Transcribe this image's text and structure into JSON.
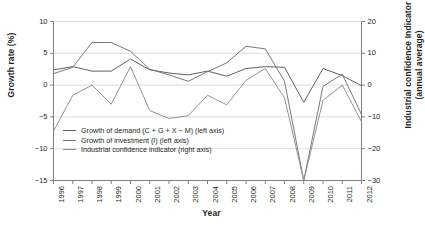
{
  "chart_data": {
    "type": "line",
    "title": "",
    "xlabel": "Year",
    "ylabel": "Growth rate (%)",
    "y2label_line1": "Industrial confidence Indicator",
    "y2label_line2": "(annual  average)",
    "x": [
      1996,
      1997,
      1998,
      1999,
      2000,
      2001,
      2002,
      2003,
      2004,
      2005,
      2006,
      2007,
      2008,
      2009,
      2010,
      2011,
      2012
    ],
    "xticklabels": [
      "1996",
      "1997",
      "1998",
      "1999",
      "2000",
      "2001",
      "2002",
      "2003",
      "2004",
      "2005",
      "2006",
      "2007",
      "2008",
      "2009",
      "2010",
      "2011",
      "2012"
    ],
    "ylim": [
      -15,
      10
    ],
    "yticks": [
      10,
      5,
      0,
      -5,
      -10,
      -15
    ],
    "yticklabels": [
      "10",
      "5",
      "0",
      "−5",
      "−10",
      "−15"
    ],
    "y2lim": [
      -30,
      20
    ],
    "y2ticks": [
      20,
      10,
      0,
      -10,
      -20,
      -30
    ],
    "y2ticklabels": [
      "20",
      "10",
      "0",
      "−10",
      "−20",
      "−30"
    ],
    "grid": true,
    "grid_axis": "y",
    "legend_position": "center-left",
    "series": [
      {
        "name": "Growth of demand (C + G + X − M) (left axis)",
        "axis": "left",
        "color": "#55595c",
        "values": [
          2.4,
          2.9,
          2.2,
          2.2,
          4.1,
          2.4,
          1.9,
          1.6,
          2.2,
          1.4,
          2.6,
          2.9,
          2.8,
          -2.7,
          2.6,
          1.5,
          -0.1
        ]
      },
      {
        "name": "Growth of investment (I) (left axis)",
        "axis": "left",
        "color": "#6f7274",
        "values": [
          1.8,
          2.8,
          6.7,
          6.7,
          5.3,
          2.5,
          1.6,
          0.6,
          2.1,
          3.5,
          6.1,
          5.7,
          0.6,
          -15.0,
          -0.2,
          1.7,
          -4.6
        ]
      },
      {
        "name": "Industrial confidence indicator (right axis)",
        "axis": "right",
        "color": "#8a8d8f",
        "values": [
          -14.5,
          -3.2,
          0.0,
          -6.0,
          5.8,
          -8.0,
          -10.5,
          -9.6,
          -3.2,
          -6.2,
          1.5,
          5.2,
          -4.0,
          -30.0,
          -4.8,
          0.0,
          -11.5
        ]
      }
    ]
  }
}
